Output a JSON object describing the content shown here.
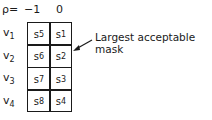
{
  "header": {
    "p_label": "ρ=",
    "columns": [
      "−1",
      "0"
    ]
  },
  "rows": [
    {
      "label": "v",
      "sub": "1",
      "cells": [
        {
          "s": "s",
          "sub": "5"
        },
        {
          "s": "s",
          "sub": "1"
        }
      ]
    },
    {
      "label": "v",
      "sub": "2",
      "cells": [
        {
          "s": "s",
          "sub": "6"
        },
        {
          "s": "s",
          "sub": "2"
        }
      ]
    },
    {
      "label": "v",
      "sub": "3",
      "cells": [
        {
          "s": "s",
          "sub": "7"
        },
        {
          "s": "s",
          "sub": "3"
        }
      ]
    },
    {
      "label": "v",
      "sub": "4",
      "cells": [
        {
          "s": "s",
          "sub": "8"
        },
        {
          "s": "s",
          "sub": "4"
        }
      ]
    }
  ],
  "annotation": {
    "text": "Largest acceptable mask",
    "arrow_target": "right edge of grid at row v2"
  }
}
